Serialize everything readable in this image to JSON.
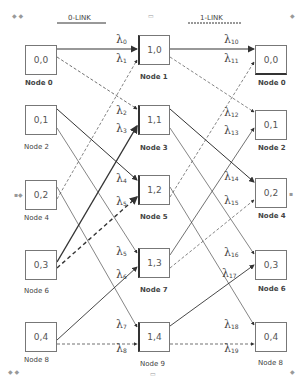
{
  "headers": {
    "left": "0-LINK",
    "right": "1-LINK"
  },
  "columns": {
    "left": [
      {
        "id": "0,0",
        "label": "Node 0"
      },
      {
        "id": "0,1",
        "label": "Node 2"
      },
      {
        "id": "0,2",
        "label": "Node 4"
      },
      {
        "id": "0,3",
        "label": "Node 6"
      },
      {
        "id": "0,4",
        "label": "Node 8"
      }
    ],
    "middle": [
      {
        "id": "1,0",
        "label": "Node 1"
      },
      {
        "id": "1,1",
        "label": "Node 3"
      },
      {
        "id": "1,2",
        "label": "Node 5"
      },
      {
        "id": "1,3",
        "label": "Node 7"
      },
      {
        "id": "1,4",
        "label": "Node 9"
      }
    ],
    "right": [
      {
        "id": "0,0",
        "label": "Node 0"
      },
      {
        "id": "0,1",
        "label": "Node 2"
      },
      {
        "id": "0,2",
        "label": "Node 4"
      },
      {
        "id": "0,3",
        "label": "Node 6"
      },
      {
        "id": "0,4",
        "label": "Node 8"
      }
    ]
  },
  "lambdas_left": [
    {
      "sym": "λ",
      "sub": "0"
    },
    {
      "sym": "λ",
      "sub": "1"
    },
    {
      "sym": "λ",
      "sub": "2"
    },
    {
      "sym": "λ",
      "sub": "3"
    },
    {
      "sym": "λ",
      "sub": "4"
    },
    {
      "sym": "λ",
      "sub": "5"
    },
    {
      "sym": "λ",
      "sub": "5"
    },
    {
      "sym": "λ",
      "sub": "6"
    },
    {
      "sym": "λ",
      "sub": "7"
    },
    {
      "sym": "λ",
      "sub": "8"
    }
  ],
  "lambdas_right": [
    {
      "sym": "λ",
      "sub": "10"
    },
    {
      "sym": "λ",
      "sub": "11"
    },
    {
      "sym": "λ",
      "sub": "12"
    },
    {
      "sym": "λ",
      "sub": "13"
    },
    {
      "sym": "λ",
      "sub": "14"
    },
    {
      "sym": "λ",
      "sub": "15"
    },
    {
      "sym": "λ",
      "sub": "16"
    },
    {
      "sym": "λ",
      "sub": "17"
    },
    {
      "sym": "λ",
      "sub": "18"
    },
    {
      "sym": "λ",
      "sub": "19"
    }
  ]
}
